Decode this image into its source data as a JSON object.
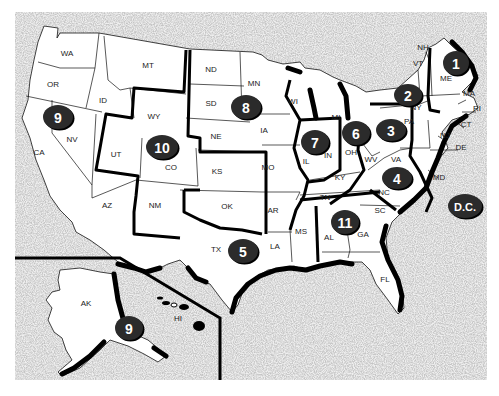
{
  "map": {
    "title": "U.S. Federal Judicial Circuits",
    "colors": {
      "background_speckle": "#d9d9d9",
      "land": "#ffffff",
      "border": "#000000",
      "badge": "#2b2b2b",
      "badge_text": "#ffffff"
    },
    "state_labels": [
      {
        "id": "WA",
        "text": "WA",
        "x": 67,
        "y": 56
      },
      {
        "id": "OR",
        "text": "OR",
        "x": 53,
        "y": 87
      },
      {
        "id": "CA",
        "text": "CA",
        "x": 39,
        "y": 155
      },
      {
        "id": "NV",
        "text": "NV",
        "x": 72,
        "y": 142
      },
      {
        "id": "ID",
        "text": "ID",
        "x": 103,
        "y": 103
      },
      {
        "id": "MT",
        "text": "MT",
        "x": 148,
        "y": 68
      },
      {
        "id": "WY",
        "text": "WY",
        "x": 154,
        "y": 119
      },
      {
        "id": "UT",
        "text": "UT",
        "x": 116,
        "y": 157
      },
      {
        "id": "CO",
        "text": "CO",
        "x": 171,
        "y": 170
      },
      {
        "id": "AZ",
        "text": "AZ",
        "x": 107,
        "y": 208
      },
      {
        "id": "NM",
        "text": "NM",
        "x": 155,
        "y": 208
      },
      {
        "id": "ND",
        "text": "ND",
        "x": 211,
        "y": 72
      },
      {
        "id": "SD",
        "text": "SD",
        "x": 211,
        "y": 106
      },
      {
        "id": "NE",
        "text": "NE",
        "x": 216,
        "y": 139
      },
      {
        "id": "KS",
        "text": "KS",
        "x": 217,
        "y": 174
      },
      {
        "id": "OK",
        "text": "OK",
        "x": 227,
        "y": 209
      },
      {
        "id": "TX",
        "text": "TX",
        "x": 216,
        "y": 252
      },
      {
        "id": "MN",
        "text": "MN",
        "x": 254,
        "y": 86
      },
      {
        "id": "IA",
        "text": "IA",
        "x": 264,
        "y": 133
      },
      {
        "id": "MO",
        "text": "MO",
        "x": 268,
        "y": 170
      },
      {
        "id": "AR",
        "text": "AR",
        "x": 273,
        "y": 213
      },
      {
        "id": "LA",
        "text": "LA",
        "x": 275,
        "y": 249
      },
      {
        "id": "WI",
        "text": "WI",
        "x": 293,
        "y": 104
      },
      {
        "id": "IL",
        "text": "IL",
        "x": 306,
        "y": 164
      },
      {
        "id": "IN",
        "text": "IN",
        "x": 328,
        "y": 158
      },
      {
        "id": "MI",
        "text": "MI",
        "x": 336,
        "y": 120
      },
      {
        "id": "OH",
        "text": "OH",
        "x": 351,
        "y": 155
      },
      {
        "id": "KY",
        "text": "KY",
        "x": 340,
        "y": 180
      },
      {
        "id": "TN",
        "text": "TN",
        "x": 325,
        "y": 200
      },
      {
        "id": "MS",
        "text": "MS",
        "x": 301,
        "y": 234
      },
      {
        "id": "AL",
        "text": "AL",
        "x": 329,
        "y": 240
      },
      {
        "id": "GA",
        "text": "GA",
        "x": 363,
        "y": 237
      },
      {
        "id": "FL",
        "text": "FL",
        "x": 385,
        "y": 282
      },
      {
        "id": "SC",
        "text": "SC",
        "x": 380,
        "y": 213
      },
      {
        "id": "NC",
        "text": "NC",
        "x": 384,
        "y": 195
      },
      {
        "id": "VA",
        "text": "VA",
        "x": 396,
        "y": 162
      },
      {
        "id": "WV",
        "text": "WV",
        "x": 371,
        "y": 162
      },
      {
        "id": "PA",
        "text": "PA",
        "x": 409,
        "y": 124
      },
      {
        "id": "NY",
        "text": "NY",
        "x": 416,
        "y": 110
      },
      {
        "id": "VT",
        "text": "VT",
        "x": 418,
        "y": 66
      },
      {
        "id": "NH",
        "text": "NH",
        "x": 423,
        "y": 50
      },
      {
        "id": "ME",
        "text": "ME",
        "x": 446,
        "y": 81
      },
      {
        "id": "MA",
        "text": "MA",
        "x": 469,
        "y": 96
      },
      {
        "id": "RI",
        "text": "RI",
        "x": 477,
        "y": 111
      },
      {
        "id": "CT",
        "text": "CT",
        "x": 466,
        "y": 127
      },
      {
        "id": "NJ",
        "text": "NJ",
        "x": 445,
        "y": 138
      },
      {
        "id": "DE",
        "text": "DE",
        "x": 461,
        "y": 150
      },
      {
        "id": "MD",
        "text": "MD",
        "x": 439,
        "y": 180
      },
      {
        "id": "AK",
        "text": "AK",
        "x": 86,
        "y": 306
      },
      {
        "id": "HI",
        "text": "HI",
        "x": 178,
        "y": 321
      }
    ],
    "circuit_badges": [
      {
        "label": "1",
        "x": 456,
        "y": 63,
        "rx": 13,
        "ry": 12
      },
      {
        "label": "2",
        "x": 408,
        "y": 95,
        "rx": 14,
        "ry": 11
      },
      {
        "label": "3",
        "x": 391,
        "y": 130,
        "rx": 15,
        "ry": 11
      },
      {
        "label": "4",
        "x": 397,
        "y": 178,
        "rx": 15,
        "ry": 11
      },
      {
        "label": "5",
        "x": 243,
        "y": 251,
        "rx": 15,
        "ry": 12
      },
      {
        "label": "6",
        "x": 356,
        "y": 133,
        "rx": 14,
        "ry": 12
      },
      {
        "label": "7",
        "x": 315,
        "y": 142,
        "rx": 14,
        "ry": 12
      },
      {
        "label": "8",
        "x": 246,
        "y": 107,
        "rx": 15,
        "ry": 12
      },
      {
        "label": "9",
        "x": 58,
        "y": 117,
        "rx": 15,
        "ry": 12
      },
      {
        "label": "10",
        "x": 162,
        "y": 147,
        "rx": 16,
        "ry": 12
      },
      {
        "label": "11",
        "x": 345,
        "y": 222,
        "rx": 14,
        "ry": 12
      },
      {
        "label": "9",
        "x": 129,
        "y": 328,
        "rx": 14,
        "ry": 12
      },
      {
        "label": "D.C.",
        "x": 465,
        "y": 206,
        "rx": 17,
        "ry": 12
      }
    ]
  }
}
